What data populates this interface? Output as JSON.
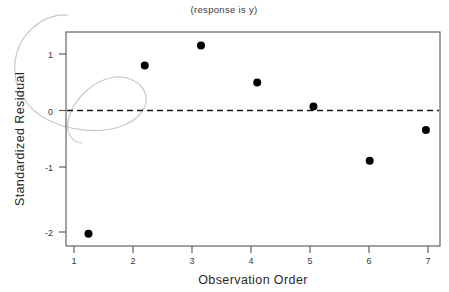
{
  "chart_data": {
    "type": "scatter",
    "title": "(response is y)",
    "xlabel": "Observation Order",
    "ylabel": "Standardized Residual",
    "x": [
      1,
      2,
      3,
      4,
      5,
      6,
      7
    ],
    "values": [
      -2.18,
      0.82,
      1.18,
      0.52,
      0.09,
      -0.88,
      -0.33
    ],
    "points": [
      {
        "x": 1,
        "y": -2.18
      },
      {
        "x": 2,
        "y": 0.82
      },
      {
        "x": 3,
        "y": 1.18
      },
      {
        "x": 4,
        "y": 0.52
      },
      {
        "x": 5,
        "y": 0.09
      },
      {
        "x": 6,
        "y": -0.88
      },
      {
        "x": 7,
        "y": -0.33
      }
    ],
    "x_ticks": [
      1,
      2,
      3,
      4,
      5,
      6,
      7
    ],
    "x_tick_labels": [
      "1",
      "2",
      "3",
      "4",
      "5",
      "6",
      "7"
    ],
    "y_ticks": [
      1,
      0,
      -1,
      -2
    ],
    "y_tick_labels": [
      "1",
      "0",
      "-1",
      "-2"
    ],
    "xlim": [
      0.6,
      7.25
    ],
    "ylim": [
      -2.4,
      1.42
    ],
    "grid": false,
    "legend": null,
    "reference_line": {
      "value": 0,
      "style": "dashed"
    },
    "marker": {
      "shape": "circle",
      "color": "#000000",
      "size": 4
    },
    "annotations": [
      {
        "name": "hand-drawn-oval-overlay",
        "color": "#c9c9c9"
      }
    ]
  },
  "chart": {
    "title": "(response is y)",
    "x_axis_title": "Observation Order",
    "y_axis_title": "Standardized Residual",
    "x_tick_labels": [
      "1",
      "2",
      "3",
      "4",
      "5",
      "6",
      "7"
    ],
    "y_tick_labels": [
      "1",
      "0",
      "-1",
      "-2"
    ]
  }
}
